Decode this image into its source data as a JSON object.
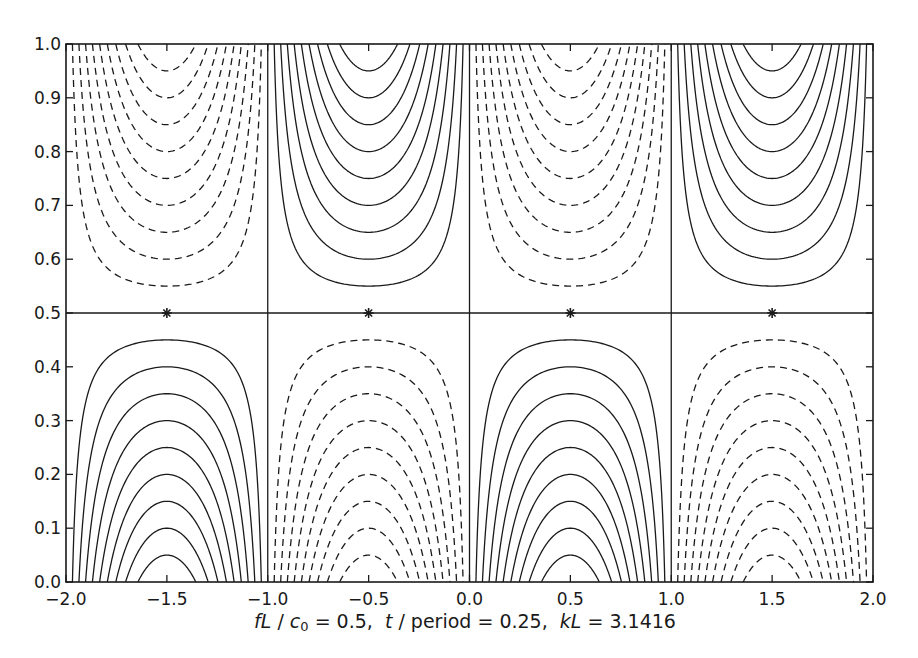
{
  "chart_data": {
    "type": "contour",
    "title": "",
    "xlabel": {
      "parts": [
        {
          "text": "fL",
          "italic": true
        },
        {
          "text": " / ",
          "italic": false
        },
        {
          "text": "c",
          "italic": true
        },
        {
          "text": "0",
          "sub": true
        },
        {
          "text": " = 0.5,  ",
          "italic": false
        },
        {
          "text": "t",
          "italic": true
        },
        {
          "text": " / period = 0.25,  ",
          "italic": false
        },
        {
          "text": "kL",
          "italic": true
        },
        {
          "text": " = 3.1416",
          "italic": false
        }
      ],
      "plain": "fL / c0 = 0.5,  t / period = 0.25,  kL = 3.1416"
    },
    "ylabel": "",
    "xlim": [
      -2.0,
      2.0
    ],
    "ylim": [
      0.0,
      1.0
    ],
    "xticks": [
      -2.0,
      -1.5,
      -1.0,
      -0.5,
      0.0,
      0.5,
      1.0,
      1.5,
      2.0
    ],
    "xtick_labels": [
      "−2.0",
      "−1.5",
      "−1.0",
      "−0.5",
      "0.0",
      "0.5",
      "1.0",
      "1.5",
      "2.0"
    ],
    "yticks": [
      0.0,
      0.1,
      0.2,
      0.3,
      0.4,
      0.5,
      0.6,
      0.7,
      0.8,
      0.9,
      1.0
    ],
    "ytick_labels": [
      "0.0",
      "0.1",
      "0.2",
      "0.3",
      "0.4",
      "0.5",
      "0.6",
      "0.7",
      "0.8",
      "0.9",
      "1.0"
    ],
    "grid": false,
    "legend": null,
    "field": "psi(x,y) = sin(pi*x) * (1 - 2*y)",
    "contour_levels_positive_solid": [
      0.1,
      0.2,
      0.3,
      0.4,
      0.5,
      0.6,
      0.7,
      0.8,
      0.9
    ],
    "contour_levels_negative_dashed": [
      -0.1,
      -0.2,
      -0.3,
      -0.4,
      -0.5,
      -0.6,
      -0.7,
      -0.8,
      -0.9
    ],
    "zero_contours": {
      "vertical_x": [
        -1.0,
        0.0,
        1.0
      ],
      "horizontal_y": [
        0.5
      ]
    },
    "cells": [
      {
        "x_range": [
          -2.0,
          -1.0
        ],
        "y_range": [
          0.0,
          0.5
        ],
        "sign": "positive",
        "style": "solid"
      },
      {
        "x_range": [
          -2.0,
          -1.0
        ],
        "y_range": [
          0.5,
          1.0
        ],
        "sign": "negative",
        "style": "dashed"
      },
      {
        "x_range": [
          -1.0,
          0.0
        ],
        "y_range": [
          0.0,
          0.5
        ],
        "sign": "negative",
        "style": "dashed"
      },
      {
        "x_range": [
          -1.0,
          0.0
        ],
        "y_range": [
          0.5,
          1.0
        ],
        "sign": "positive",
        "style": "solid"
      },
      {
        "x_range": [
          0.0,
          1.0
        ],
        "y_range": [
          0.0,
          0.5
        ],
        "sign": "positive",
        "style": "solid"
      },
      {
        "x_range": [
          0.0,
          1.0
        ],
        "y_range": [
          0.5,
          1.0
        ],
        "sign": "negative",
        "style": "dashed"
      },
      {
        "x_range": [
          1.0,
          2.0
        ],
        "y_range": [
          0.0,
          0.5
        ],
        "sign": "negative",
        "style": "dashed"
      },
      {
        "x_range": [
          1.0,
          2.0
        ],
        "y_range": [
          0.5,
          1.0
        ],
        "sign": "positive",
        "style": "solid"
      }
    ],
    "markers": {
      "symbol": "*",
      "points": [
        {
          "x": -1.5,
          "y": 0.5
        },
        {
          "x": -0.5,
          "y": 0.5
        },
        {
          "x": 0.5,
          "y": 0.5
        },
        {
          "x": 1.5,
          "y": 0.5
        }
      ]
    },
    "line_color": "#1a1a1a"
  },
  "layout": {
    "plot_left": 66,
    "plot_top": 44,
    "plot_right": 873,
    "plot_bottom": 582
  }
}
